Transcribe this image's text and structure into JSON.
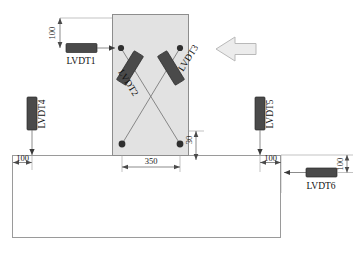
{
  "diagram": {
    "colors": {
      "column_fill": "#e2e2e2",
      "column_stroke": "#8d8d8d",
      "beam_fill": "#ffffff",
      "beam_stroke": "#8d8d8d",
      "sensor_fill": "#4a4a4a",
      "sensor_stroke": "#2a2a2a",
      "arrow_fill": "#ececec",
      "arrow_stroke": "#b9b9b9",
      "dim_line": "#5a5a5a",
      "text": "#111111"
    },
    "column": {
      "name": "column"
    },
    "beam": {
      "name": "beam"
    },
    "load_arrow": {
      "name": "load-direction-arrow",
      "direction": "left"
    },
    "sensors": [
      {
        "id": "LVDT1",
        "label": "LVDT1",
        "orientation": "horizontal",
        "label_orientation": "horizontal"
      },
      {
        "id": "LVDT2",
        "label": "LVDT2",
        "orientation": "diagonal",
        "label_orientation": "rotated"
      },
      {
        "id": "LVDT3",
        "label": "LVDT3",
        "orientation": "diagonal",
        "label_orientation": "rotated"
      },
      {
        "id": "LVDT4",
        "label": "LVDT4",
        "orientation": "vertical",
        "label_orientation": "rotated"
      },
      {
        "id": "LVDT5",
        "label": "LVDT5",
        "orientation": "vertical",
        "label_orientation": "rotated"
      },
      {
        "id": "LVDT6",
        "label": "LVDT6",
        "orientation": "horizontal",
        "label_orientation": "horizontal"
      }
    ],
    "dimensions": [
      {
        "id": "dim-top-left-100",
        "value": "100",
        "orientation": "vertical"
      },
      {
        "id": "dim-gauge-350",
        "value": "350",
        "orientation": "horizontal"
      },
      {
        "id": "dim-offset-30",
        "value": "30",
        "orientation": "vertical"
      },
      {
        "id": "dim-left-100",
        "value": "100",
        "orientation": "horizontal"
      },
      {
        "id": "dim-right-100",
        "value": "100",
        "orientation": "horizontal"
      },
      {
        "id": "dim-lvdt6-100",
        "value": "100",
        "orientation": "vertical"
      }
    ]
  }
}
